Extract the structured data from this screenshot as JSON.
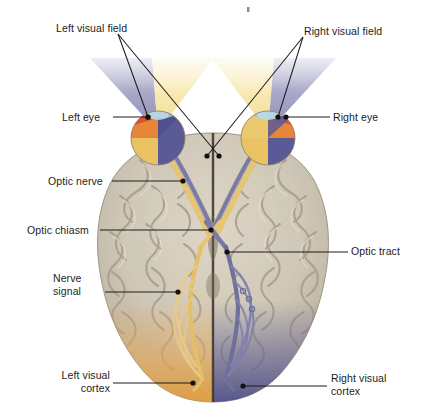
{
  "figure": {
    "type": "anatomical-diagram",
    "background_color": "#ffffff",
    "speck_artifact": {
      "present": true,
      "x": 248,
      "y": 9,
      "color": "#8d8d8d"
    }
  },
  "labels": {
    "left_visual_field": {
      "text": "Left visual field",
      "x": 56,
      "y": 22,
      "align": "left"
    },
    "right_visual_field": {
      "text": "Right visual field",
      "x": 304,
      "y": 25,
      "align": "left"
    },
    "left_eye": {
      "text": "Left eye",
      "x": 62,
      "y": 111,
      "align": "left"
    },
    "right_eye": {
      "text": "Right eye",
      "x": 333,
      "y": 111,
      "align": "left"
    },
    "optic_nerve": {
      "text": "Optic nerve",
      "x": 48,
      "y": 175,
      "align": "left"
    },
    "optic_chiasm": {
      "text": "Optic chiasm",
      "x": 27,
      "y": 224,
      "align": "left"
    },
    "optic_tract": {
      "text": "Optic tract",
      "x": 351,
      "y": 245,
      "align": "left"
    },
    "nerve_signal": {
      "text": "Nerve\nsignal",
      "x": 53,
      "y": 272,
      "align": "left"
    },
    "left_visual_cortex": {
      "text": "Left visual\ncortex",
      "x": 46,
      "y": 369,
      "align": "right"
    },
    "right_visual_cortex": {
      "text": "Right visual\ncortex",
      "x": 331,
      "y": 372,
      "align": "left"
    }
  },
  "colors": {
    "brain_fill": "#cfc7b8",
    "brain_shadow": "#a79e8d",
    "brain_highlight": "#e6e0d4",
    "left_field_outer_purple": "#8a8ab4",
    "left_field_inner_yellow": "#f5e3a8",
    "center_white": "#ffffff",
    "eye_red": "#d9542e",
    "eye_orange": "#e8a33c",
    "eye_yellow": "#edc55f",
    "eye_blue": "#5a5a96",
    "cornea_blue": "#9fc6dd",
    "nerve_yellow": "#e8c573",
    "nerve_blue": "#6f7099",
    "cortex_orange": "#e8a74e",
    "cortex_blue": "#5b5a94",
    "leader_line": "#1c1c1c",
    "label_text": "#1c1c1c"
  },
  "pathway": {
    "left_eye": {
      "cx": 158,
      "cy": 138,
      "r": 27
    },
    "right_eye": {
      "cx": 268,
      "cy": 138,
      "r": 27
    },
    "chiasm": {
      "x": 213,
      "y": 232
    },
    "left_visual_cortex": {
      "x": 190,
      "y": 390
    },
    "right_visual_cortex": {
      "x": 238,
      "y": 390
    }
  },
  "leaders": {
    "left_visual_field": [
      {
        "from": [
          118,
          34
        ],
        "to": [
          219,
          156
        ]
      },
      {
        "from": [
          118,
          34
        ],
        "to": [
          148,
          117
        ]
      }
    ],
    "right_visual_field": [
      {
        "from": [
          303,
          37
        ],
        "to": [
          207,
          156
        ]
      },
      {
        "from": [
          303,
          37
        ],
        "to": [
          278,
          117
        ]
      }
    ],
    "left_eye": [
      {
        "from": [
          113,
          117
        ],
        "to": [
          148,
          117
        ]
      }
    ],
    "right_eye": [
      {
        "from": [
          330,
          117
        ],
        "to": [
          286,
          117
        ]
      }
    ],
    "optic_nerve": [
      {
        "from": [
          112,
          181
        ],
        "to": [
          183,
          181
        ]
      }
    ],
    "optic_chiasm": [
      {
        "from": [
          100,
          230
        ],
        "to": [
          211,
          230
        ]
      }
    ],
    "optic_tract": [
      {
        "from": [
          348,
          252
        ],
        "to": [
          227,
          252
        ]
      }
    ],
    "nerve_signal": [
      {
        "from": [
          105,
          292
        ],
        "to": [
          178,
          292
        ]
      }
    ],
    "left_visual_cortex": [
      {
        "from": [
          113,
          383
        ],
        "to": [
          193,
          383
        ]
      }
    ],
    "right_visual_cortex": [
      {
        "from": [
          327,
          386
        ],
        "to": [
          243,
          386
        ]
      }
    ]
  }
}
